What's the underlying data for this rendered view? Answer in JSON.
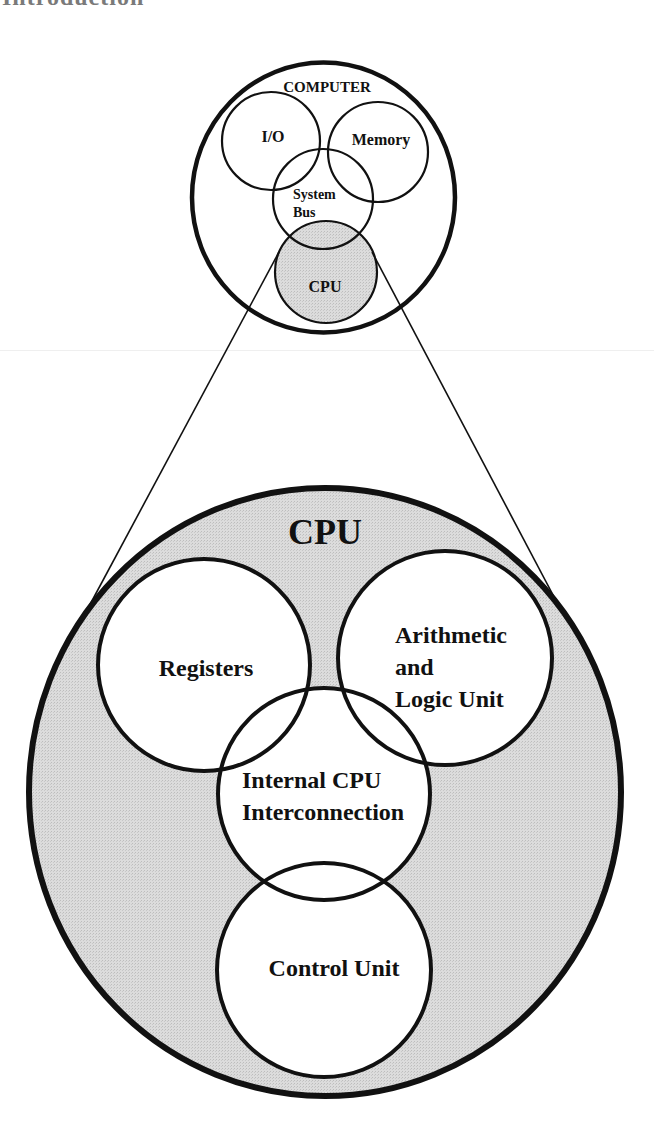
{
  "page": {
    "clipped_heading": "Introduction"
  },
  "colors": {
    "background": "#ffffff",
    "cpu_fill": "#d6d6d6",
    "stroke": "#111111"
  },
  "computer_diagram": {
    "title": "COMPUTER",
    "components": {
      "io": "I/O",
      "memory": "Memory",
      "system_bus_line1": "System",
      "system_bus_line2": "Bus",
      "cpu": "CPU"
    }
  },
  "cpu_diagram": {
    "title": "CPU",
    "components": {
      "registers": "Registers",
      "alu_line1": "Arithmetic",
      "alu_line2": "and",
      "alu_line3": "Logic Unit",
      "interconnect_line1": "Internal CPU",
      "interconnect_line2": "Interconnection",
      "control_unit": "Control Unit"
    }
  }
}
